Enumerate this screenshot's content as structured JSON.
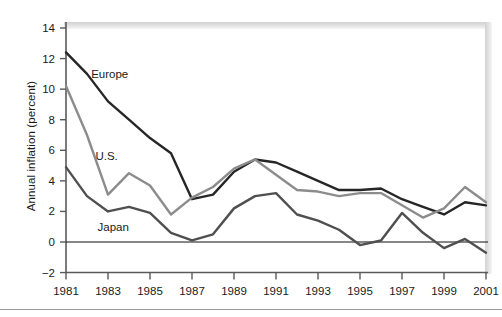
{
  "chart_data": {
    "type": "line",
    "title": "",
    "xlabel": "",
    "ylabel": "Annual inflation (percent)",
    "grid": false,
    "legend_position": "inline-labels",
    "xlim": [
      1981,
      2001
    ],
    "ylim": [
      -2,
      14
    ],
    "yticks": [
      -2,
      0,
      2,
      4,
      6,
      8,
      10,
      12,
      14
    ],
    "ytick_labels": [
      "−2",
      "0",
      "2",
      "4",
      "6",
      "8",
      "10",
      "12",
      "14"
    ],
    "xticks": [
      1981,
      1983,
      1985,
      1987,
      1989,
      1991,
      1993,
      1995,
      1997,
      1999,
      2001
    ],
    "xtick_labels": [
      "1981",
      "1983",
      "1985",
      "1987",
      "1989",
      "1991",
      "1993",
      "1995",
      "1997",
      "1999",
      "2001"
    ],
    "x": [
      1981,
      1982,
      1983,
      1984,
      1985,
      1986,
      1987,
      1988,
      1989,
      1990,
      1991,
      1992,
      1993,
      1994,
      1995,
      1996,
      1997,
      1998,
      1999,
      2000,
      2001
    ],
    "zero_line": 0,
    "series": [
      {
        "name": "Europe",
        "color": "#262626",
        "label_x": 1982.2,
        "label_y": 11.0,
        "values": [
          12.4,
          11.0,
          9.2,
          8.0,
          6.8,
          5.8,
          2.8,
          3.1,
          4.6,
          5.4,
          5.2,
          4.6,
          4.0,
          3.4,
          3.4,
          3.5,
          2.8,
          2.3,
          1.8,
          2.6,
          2.4
        ]
      },
      {
        "name": "U.S.",
        "color": "#8c8c8c",
        "label_x": 1982.4,
        "label_y": 5.6,
        "values": [
          10.2,
          7.0,
          3.1,
          4.5,
          3.7,
          1.8,
          2.9,
          3.6,
          4.8,
          5.4,
          4.4,
          3.4,
          3.3,
          3.0,
          3.2,
          3.2,
          2.4,
          1.6,
          2.2,
          3.6,
          2.6
        ]
      },
      {
        "name": "Japan",
        "color": "#4f4f4f",
        "label_x": 1982.5,
        "label_y": 1.0,
        "values": [
          4.9,
          3.0,
          2.0,
          2.3,
          1.9,
          0.6,
          0.1,
          0.5,
          2.2,
          3.0,
          3.2,
          1.8,
          1.4,
          0.8,
          -0.2,
          0.1,
          1.9,
          0.6,
          -0.4,
          0.2,
          -0.7
        ]
      }
    ]
  }
}
